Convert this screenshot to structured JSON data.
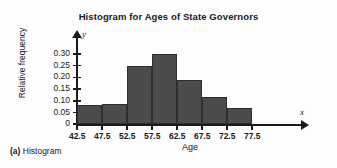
{
  "figure": {
    "caption_tag": "(a)",
    "caption_text": "Histogram"
  },
  "chart_data": {
    "type": "bar",
    "title": "Histogram for Ages of State Governors",
    "xlabel": "Age",
    "ylabel": "Relative frequency",
    "x_axis_symbol": "x",
    "y_axis_symbol": "y",
    "grid": false,
    "legend": "none",
    "bin_width": 5,
    "bin_edges": [
      42.5,
      47.5,
      52.5,
      57.5,
      62.5,
      67.5,
      72.5,
      77.5
    ],
    "categories": [
      "42.5-47.5",
      "47.5-52.5",
      "52.5-57.5",
      "57.5-62.5",
      "62.5-67.5",
      "67.5-72.5",
      "72.5-77.5"
    ],
    "values": [
      0.08,
      0.085,
      0.25,
      0.3,
      0.19,
      0.115,
      0.07
    ],
    "xlim": [
      42.5,
      80.0
    ],
    "ylim": [
      0,
      0.325
    ],
    "xticks": [
      "42.5",
      "47.5",
      "52.5",
      "57.5",
      "62.5",
      "67.5",
      "72.5",
      "77.5"
    ],
    "xtick_values": [
      42.5,
      47.5,
      52.5,
      57.5,
      62.5,
      67.5,
      72.5,
      77.5
    ],
    "yticks": [
      "0",
      "0.05",
      "0.10",
      "0.15",
      "0.20",
      "0.25",
      "0.30"
    ],
    "ytick_values": [
      0,
      0.05,
      0.1,
      0.15,
      0.2,
      0.25,
      0.3
    ],
    "bar_color": "#4b4b4b",
    "bar_edge_color": "#2e2e2e",
    "axis_color": "#1b1b1b"
  }
}
